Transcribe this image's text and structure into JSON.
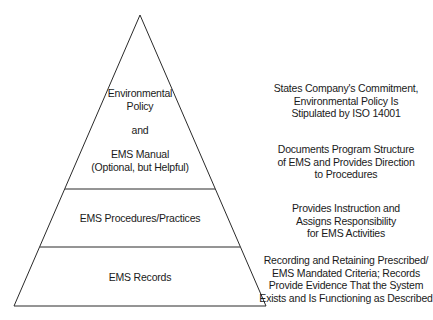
{
  "diagram": {
    "type": "pyramid",
    "tiers": [
      {
        "id": "policy-manual",
        "lines": [
          "Environmental",
          "Policy",
          "",
          "and",
          "",
          "EMS Manual",
          "(Optional, but Helpful)"
        ],
        "description": [
          "States Company's Commitment,",
          "Environmental Policy Is",
          "Stipulated by ISO 14001",
          "",
          "",
          "Documents Program Structure",
          "of EMS and Provides Direction",
          "to Procedures"
        ]
      },
      {
        "id": "procedures",
        "lines": [
          "EMS Procedures/Practices"
        ],
        "description": [
          "Provides Instruction and",
          "Assigns Responsibility",
          "for EMS Activities"
        ]
      },
      {
        "id": "records",
        "lines": [
          "EMS Records"
        ],
        "description": [
          "Recording and Retaining Prescribed/",
          "EMS Mandated Criteria; Records",
          "Provide Evidence That the System",
          "Exists and Is Functioning as Described"
        ]
      }
    ],
    "colors": {
      "stroke": "#2a2a2a",
      "background": "#ffffff",
      "text": "#1a1a1a"
    }
  }
}
